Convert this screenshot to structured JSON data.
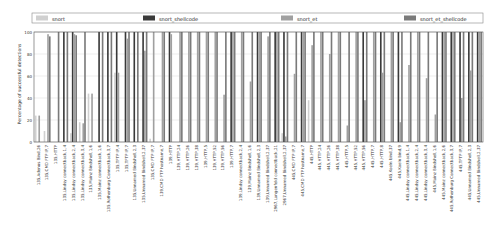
{
  "chart_data": {
    "type": "bar",
    "title": "",
    "xlabel": "",
    "ylabel": "Percentage of successful detections",
    "ylim": [
      0,
      100
    ],
    "yticks": [
      "0",
      "20",
      "40",
      "60",
      "80",
      "100"
    ],
    "grid": true,
    "legend_position": "top",
    "categories": [
      "135,Adenus Bind,26",
      "135,CMD FTP IP,7",
      "135,HTTP",
      "135,Lindsy connectback,1,4",
      "135,Lindsy connectback,2,4",
      "135,Lindsy connectback,3,4",
      "135,Mainz Bindshell,1,6",
      "135,Mainz connectback,1,6",
      "135,Rothenburg Connectback,3,7",
      "135,TFTP IP,4",
      "135,TFTP IP,7",
      "135,Unnamed Bindshell,2,3",
      "135,Unnamed Bindshell,2,37",
      "135,CMD FTP IP,7",
      "139,CMD FTP hostname,7",
      "139,HTTP",
      "139,HTTP,24",
      "139,HTTP,26",
      "139,HTTP,38",
      "139,HTTP,5",
      "139,HTTP,52",
      "139,HTTP,56",
      "139,HTTP,7",
      "139,Lindsy connectback,2,4",
      "139,Mainz Bindshell,1,6",
      "139,Unnamed Bindshell,2,3",
      "139,Unnamed Bindshell,2,37",
      "2967,Langenfeld connectback,21",
      "2967,Unnamed Bindshell,2,37",
      "445,CMD FTP IP,7",
      "445,CMD FTP hostname,7",
      "445,HTTP",
      "445,HTTP,24",
      "445,HTTP,26",
      "445,HTTP,38",
      "445,HTTP,5",
      "445,HTTP,52",
      "445,HTTP,56",
      "445,HTTP,7",
      "445,HTTP,8",
      "445,Koeln bind,37",
      "445,Koeln bind,9",
      "445,Lindsy connectback,1,4",
      "445,Lindsy connectback,2,4",
      "445,Lindsy connectback,3,4",
      "445,Mainz Bindshell,1,6",
      "445,Mainz connectback,2,6",
      "445,Rothenburg Connectback,3,7",
      "445,TFTP IP,7",
      "445,Unnamed Bindshell,2,3",
      "445,Unnamed Bindshell,2,37"
    ],
    "series": [
      {
        "name": "snort",
        "color": "#d0d0d0",
        "values": [
          24,
          10,
          0,
          0,
          8,
          18,
          44,
          0,
          0,
          63,
          0,
          0,
          0,
          3,
          0,
          0,
          0,
          0,
          0,
          0,
          0,
          0,
          0,
          0,
          0,
          0,
          0,
          0,
          8,
          0,
          0,
          38,
          0,
          0,
          0,
          0,
          0,
          0,
          0,
          0,
          0,
          0,
          0,
          0,
          0,
          0,
          0,
          0,
          0,
          0,
          0
        ]
      },
      {
        "name": "snort_shellcode",
        "color": "#3a3a3a",
        "values": [
          0,
          0,
          0,
          100,
          100,
          0,
          0,
          100,
          100,
          100,
          100,
          100,
          100,
          0,
          0,
          100,
          0,
          0,
          0,
          0,
          0,
          0,
          100,
          0,
          0,
          100,
          0,
          100,
          100,
          0,
          100,
          0,
          0,
          0,
          0,
          0,
          0,
          100,
          0,
          100,
          0,
          100,
          0,
          0,
          0,
          0,
          100,
          100,
          100,
          100,
          100
        ]
      },
      {
        "name": "snort_et",
        "color": "#a0a0a0",
        "values": [
          24,
          98,
          0,
          0,
          98,
          17,
          44,
          0,
          0,
          63,
          94,
          0,
          83,
          100,
          100,
          98,
          100,
          100,
          100,
          100,
          100,
          43,
          100,
          100,
          55,
          100,
          96,
          100,
          5,
          62,
          100,
          88,
          100,
          80,
          100,
          15,
          100,
          38,
          100,
          63,
          100,
          18,
          70,
          100,
          58,
          25,
          100,
          100,
          40,
          65,
          100
        ]
      },
      {
        "name": "snort_et_shellcode",
        "color": "#7a7a7a",
        "values": [
          0,
          96,
          100,
          100,
          97,
          100,
          0,
          100,
          100,
          0,
          100,
          100,
          100,
          0,
          100,
          0,
          100,
          100,
          100,
          100,
          100,
          100,
          100,
          100,
          100,
          100,
          100,
          100,
          100,
          100,
          100,
          100,
          100,
          100,
          100,
          100,
          100,
          100,
          100,
          100,
          100,
          100,
          100,
          100,
          100,
          100,
          100,
          100,
          100,
          100,
          100
        ]
      }
    ]
  }
}
